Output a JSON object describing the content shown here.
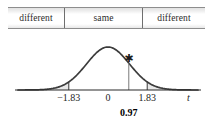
{
  "figure": {
    "width": 213,
    "height": 124,
    "background": "#ffffff"
  },
  "decision_bar": {
    "cells": [
      {
        "label": "different",
        "region": "left-reject"
      },
      {
        "label": "same",
        "region": "fail-to-reject"
      },
      {
        "label": "different",
        "region": "right-reject"
      }
    ]
  },
  "chart_data": {
    "type": "line",
    "title": "",
    "subtitle": "",
    "xlabel": "t",
    "ylabel": "",
    "grid": false,
    "legend": null,
    "curve": "standard normal / t distribution density",
    "xlim": [
      -4.2,
      4.2
    ],
    "ylim": [
      0,
      0.43
    ],
    "axis_ticks": [
      {
        "value": -1.83,
        "label": "−1.83"
      },
      {
        "value": 0,
        "label": "0"
      },
      {
        "value": 1.83,
        "label": "1.83"
      }
    ],
    "critical_values": [
      -1.83,
      1.83
    ],
    "shaded_regions": [
      {
        "name": "left-tail",
        "from": -4.2,
        "to": -1.83,
        "color": "#e8e8e8"
      },
      {
        "name": "right-tail",
        "from": 1.83,
        "to": 4.2,
        "color": "#e8e8e8"
      }
    ],
    "markers": [
      {
        "name": "test-statistic",
        "glyph": "★",
        "value": 0.97,
        "label": "0.97",
        "bold": true
      }
    ],
    "colors": {
      "curve": "#3a3a3a",
      "axis": "#2b2b2b",
      "shade": "#e8e8e8",
      "marker": "#1a1a1a"
    }
  },
  "axis": {
    "tick_labels": {
      "left_critical": "−1.83",
      "center": "0",
      "right_critical": "1.83"
    },
    "variable_symbol": "t"
  },
  "statistic": {
    "star_glyph": "✱",
    "value_label": "0.97"
  }
}
